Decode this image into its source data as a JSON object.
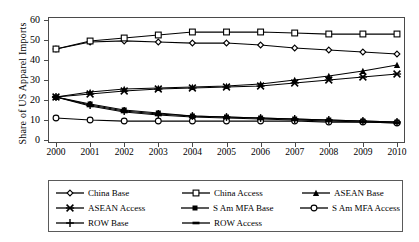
{
  "chart_data": {
    "type": "line",
    "title": "",
    "xlabel": "",
    "ylabel": "Share of US Apparel Imports",
    "x": [
      2000,
      2001,
      2002,
      2003,
      2004,
      2005,
      2006,
      2007,
      2008,
      2009,
      2010
    ],
    "xtick_labels": [
      "2000",
      "2001",
      "2002",
      "2003",
      "2004",
      "2005",
      "2006",
      "2007",
      "2008",
      "2009",
      "2010"
    ],
    "ytick_labels": [
      "0",
      "10",
      "20",
      "30",
      "40",
      "50",
      "60"
    ],
    "ylim": [
      0,
      60
    ],
    "ytick_values": [
      0,
      10,
      20,
      30,
      40,
      50,
      60
    ],
    "xlim": [
      2000,
      2010
    ],
    "grid": false,
    "legend_position": "below-plot",
    "series": [
      {
        "name": "China Base",
        "marker": "open-diamond",
        "values": [
          45.5,
          49.0,
          49.5,
          49.0,
          48.5,
          48.5,
          47.5,
          46.0,
          45.0,
          44.0,
          43.0
        ]
      },
      {
        "name": "China Access",
        "marker": "open-square",
        "values": [
          45.5,
          49.5,
          51.0,
          52.5,
          54.0,
          54.0,
          54.0,
          53.5,
          53.0,
          53.0,
          53.0
        ]
      },
      {
        "name": "ASEAN Base",
        "marker": "filled-triangle",
        "values": [
          21.5,
          24.0,
          25.5,
          26.0,
          26.5,
          27.0,
          28.0,
          30.0,
          32.0,
          34.5,
          37.5
        ]
      },
      {
        "name": "ASEAN Access",
        "marker": "cross-x",
        "values": [
          21.5,
          23.0,
          24.5,
          25.5,
          26.0,
          26.5,
          27.0,
          28.5,
          30.0,
          31.5,
          33.0
        ]
      },
      {
        "name": "S Am MFA Base",
        "marker": "filled-square",
        "values": [
          21.5,
          18.0,
          15.0,
          13.5,
          12.0,
          11.5,
          11.0,
          10.5,
          10.0,
          9.5,
          9.0
        ]
      },
      {
        "name": "S Am MFA Access",
        "marker": "open-circle",
        "values": [
          11.0,
          10.0,
          9.5,
          9.5,
          9.5,
          9.5,
          9.5,
          9.5,
          9.0,
          9.0,
          8.5
        ]
      },
      {
        "name": "ROW Base",
        "marker": "plus",
        "values": [
          21.5,
          17.5,
          14.5,
          13.0,
          12.0,
          11.5,
          11.0,
          10.5,
          10.0,
          9.5,
          9.0
        ]
      },
      {
        "name": "ROW Access",
        "marker": "filled-dash",
        "values": [
          21.5,
          17.0,
          14.0,
          12.5,
          11.5,
          11.0,
          10.5,
          10.0,
          9.5,
          9.0,
          8.5
        ]
      }
    ]
  },
  "legend": {
    "rows": [
      [
        {
          "label": "China Base",
          "marker": "open-diamond"
        },
        {
          "label": "China Access",
          "marker": "open-square"
        },
        {
          "label": "ASEAN Base",
          "marker": "filled-triangle"
        }
      ],
      [
        {
          "label": "ASEAN Access",
          "marker": "cross-x"
        },
        {
          "label": "S Am MFA Base",
          "marker": "filled-square"
        },
        {
          "label": "S Am MFA Access",
          "marker": "open-circle"
        }
      ],
      [
        {
          "label": "ROW Base",
          "marker": "plus"
        },
        {
          "label": "ROW Access",
          "marker": "filled-dash"
        }
      ]
    ]
  },
  "colors": {
    "line": "#000000",
    "axis": "#4a4a4a",
    "background": "#ffffff"
  }
}
